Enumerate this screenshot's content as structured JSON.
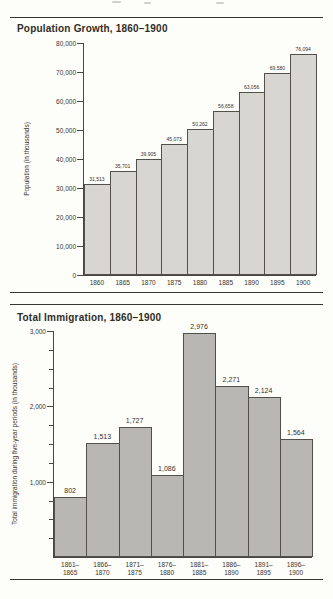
{
  "page": {
    "background": "#fdfdfa",
    "ink": "#38352f"
  },
  "chart_data": [
    {
      "type": "bar",
      "title": "Population Growth, 1860–1900",
      "ylabel": "Population (in thousands)",
      "xlabel": "",
      "categories": [
        "1860",
        "1865",
        "1870",
        "1875",
        "1880",
        "1885",
        "1890",
        "1895",
        "1900"
      ],
      "values": [
        31513,
        35701,
        39905,
        45073,
        50262,
        56658,
        63056,
        69580,
        76094
      ],
      "value_labels": [
        "31,513",
        "35,701",
        "39,905",
        "45,073",
        "50,262",
        "56,658",
        "63,056",
        "69,580",
        "76,094"
      ],
      "ylim": [
        0,
        80000
      ],
      "yticks": [
        {
          "value": 0,
          "label": "0"
        },
        {
          "value": 10000,
          "label": "10,000"
        },
        {
          "value": 20000,
          "label": "20,000"
        },
        {
          "value": 30000,
          "label": "30,000"
        },
        {
          "value": 40000,
          "label": "40,000"
        },
        {
          "value": 50000,
          "label": "50,000"
        },
        {
          "value": 60000,
          "label": "60,000"
        },
        {
          "value": 70000,
          "label": "70,000"
        },
        {
          "value": 80000,
          "label": "80,000"
        }
      ],
      "grid": false,
      "legend": "none",
      "bar_fill": "#d7d6d2",
      "bar_border": "#53504a"
    },
    {
      "type": "bar",
      "title": "Total Immigration, 1860–1900",
      "ylabel": "Total immigration during five-year periods (in thousands)",
      "xlabel": "",
      "categories": [
        [
          "1861–",
          "1865"
        ],
        [
          "1866–",
          "1870"
        ],
        [
          "1871–",
          "1875"
        ],
        [
          "1876–",
          "1880"
        ],
        [
          "1881–",
          "1885"
        ],
        [
          "1886–",
          "1890"
        ],
        [
          "1891–",
          "1895"
        ],
        [
          "1896–",
          "1900"
        ]
      ],
      "values": [
        802,
        1513,
        1727,
        1086,
        2976,
        2271,
        2124,
        1564
      ],
      "value_labels": [
        "802",
        "1,513",
        "1,727",
        "1,086",
        "2,976",
        "2,271",
        "2,124",
        "1,564"
      ],
      "ylim": [
        0,
        3000
      ],
      "yticks": [
        {
          "value": 1000,
          "label": "1,000"
        },
        {
          "value": 2000,
          "label": "2,000"
        },
        {
          "value": 3000,
          "label": "3,000"
        }
      ],
      "minor_ytick_step": 250,
      "grid": false,
      "legend": "none",
      "bar_fill": "#b8b7b3",
      "bar_border": "#53504a"
    }
  ]
}
